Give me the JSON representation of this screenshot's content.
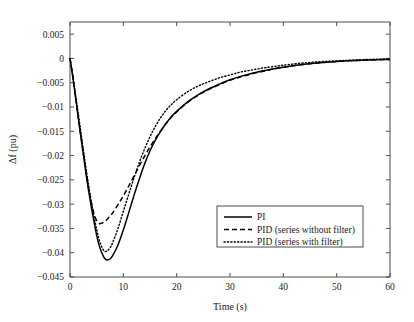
{
  "chart_data": {
    "type": "line",
    "title": "",
    "xlabel": "Time (s)",
    "ylabel": "Δf (pu)",
    "xlim": [
      0,
      60
    ],
    "ylim": [
      -0.045,
      0.0075
    ],
    "xticks": [
      0,
      10,
      20,
      30,
      40,
      50,
      60
    ],
    "xticklabels": [
      "0",
      "10",
      "20",
      "30",
      "40",
      "50",
      "60"
    ],
    "yticks": [
      0.005,
      0,
      -0.005,
      -0.01,
      -0.015,
      -0.02,
      -0.025,
      -0.03,
      -0.035,
      -0.04,
      -0.045
    ],
    "yticklabels": [
      "0.005",
      "0",
      "−0.005",
      "−0.01",
      "−0.015",
      "−0.02",
      "−0.025",
      "−0.03",
      "−0.035",
      "−0.04",
      "−0.045"
    ],
    "grid": false,
    "legend_position": "lower right",
    "legend": [
      "PI",
      "PID (series without filter)",
      "PID (series with filter)"
    ],
    "x": [
      0,
      0.5,
      1,
      1.5,
      2,
      2.5,
      3,
      3.5,
      4,
      4.5,
      5,
      5.5,
      6,
      6.5,
      7,
      7.5,
      8,
      9,
      10,
      11,
      12,
      13,
      14,
      15,
      16,
      17,
      18,
      19,
      20,
      22,
      24,
      26,
      28,
      30,
      32,
      34,
      36,
      38,
      40,
      44,
      48,
      52,
      56,
      60
    ],
    "series": [
      {
        "name": "PI",
        "style": "solid",
        "color": "#000000",
        "min_value": -0.0415,
        "min_time": 6.5,
        "values": [
          0,
          -0.0036,
          -0.0077,
          -0.0118,
          -0.0158,
          -0.0197,
          -0.0237,
          -0.0273,
          -0.0306,
          -0.0336,
          -0.0364,
          -0.0386,
          -0.0401,
          -0.0412,
          -0.0415,
          -0.0413,
          -0.0406,
          -0.0384,
          -0.0353,
          -0.0318,
          -0.0282,
          -0.0248,
          -0.0217,
          -0.019,
          -0.0168,
          -0.015,
          -0.0134,
          -0.012,
          -0.0109,
          -0.009,
          -0.0075,
          -0.0063,
          -0.0053,
          -0.0044,
          -0.0037,
          -0.0031,
          -0.0026,
          -0.0022,
          -0.0018,
          -0.0012,
          -0.0008,
          -0.0005,
          -0.0003,
          -0.0002
        ]
      },
      {
        "name": "PID (series without filter)",
        "style": "dashed",
        "color": "#000000",
        "min_value": -0.034,
        "min_time": 5.6,
        "values": [
          0,
          -0.0036,
          -0.0076,
          -0.0117,
          -0.0157,
          -0.0196,
          -0.0234,
          -0.0268,
          -0.0297,
          -0.032,
          -0.0334,
          -0.034,
          -0.0339,
          -0.0336,
          -0.0331,
          -0.0325,
          -0.0318,
          -0.0301,
          -0.0283,
          -0.0263,
          -0.0242,
          -0.0221,
          -0.0201,
          -0.0182,
          -0.0165,
          -0.0149,
          -0.0134,
          -0.0121,
          -0.011,
          -0.0091,
          -0.0076,
          -0.0064,
          -0.0054,
          -0.0045,
          -0.0038,
          -0.0032,
          -0.0027,
          -0.0022,
          -0.0018,
          -0.0012,
          -0.0008,
          -0.0005,
          -0.0003,
          -0.0002
        ]
      },
      {
        "name": "PID (series with filter)",
        "style": "dotted",
        "color": "#000000",
        "min_value": -0.0397,
        "min_time": 6.4,
        "values": [
          0,
          -0.0033,
          -0.0071,
          -0.011,
          -0.0149,
          -0.0188,
          -0.0226,
          -0.0262,
          -0.0295,
          -0.0325,
          -0.0352,
          -0.0374,
          -0.0389,
          -0.0397,
          -0.0396,
          -0.039,
          -0.0379,
          -0.035,
          -0.0315,
          -0.028,
          -0.0246,
          -0.0214,
          -0.0186,
          -0.0161,
          -0.014,
          -0.0122,
          -0.0107,
          -0.0095,
          -0.0085,
          -0.0069,
          -0.0057,
          -0.0048,
          -0.004,
          -0.0034,
          -0.0028,
          -0.0024,
          -0.002,
          -0.0017,
          -0.0014,
          -0.0009,
          -0.0006,
          -0.0004,
          -0.0002,
          -0.0001
        ]
      }
    ]
  }
}
